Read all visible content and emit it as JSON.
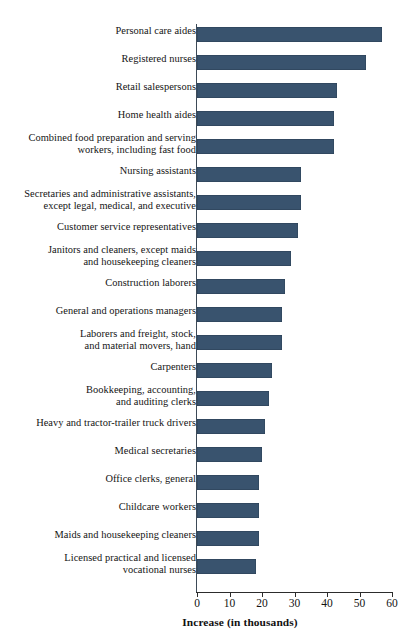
{
  "chart_data": {
    "type": "bar",
    "orientation": "horizontal",
    "title": "",
    "subtitle": "",
    "xlabel": "Increase (in thousands)",
    "ylabel": "",
    "xlim": [
      0,
      60
    ],
    "xticks": [
      0,
      10,
      20,
      30,
      40,
      50,
      60
    ],
    "xtick_labels": [
      "0",
      "10",
      "20",
      "30",
      "40",
      "50",
      "60"
    ],
    "grid": false,
    "legend": null,
    "bar_color": "#39536e",
    "axis_color": "#2c2c2c",
    "categories": [
      "Personal care aides",
      "Registered nurses",
      "Retail salespersons",
      "Home health aides",
      "Combined food preparation and serving\nworkers, including fast food",
      "Nursing assistants",
      "Secretaries and administrative assistants,\nexcept legal, medical, and executive",
      "Customer service representatives",
      "Janitors and cleaners, except maids\nand housekeeping cleaners",
      "Construction laborers",
      "General and operations managers",
      "Laborers and freight, stock,\nand material movers, hand",
      "Carpenters",
      "Bookkeeping, accounting,\nand auditing clerks",
      "Heavy and tractor-trailer truck drivers",
      "Medical secretaries",
      "Office clerks, general",
      "Childcare workers",
      "Maids and housekeeping cleaners",
      "Licensed practical and licensed\nvocational nurses"
    ],
    "values": [
      57,
      52,
      43,
      42,
      42,
      32,
      32,
      31,
      29,
      27,
      26,
      26,
      23,
      22,
      21,
      20,
      19,
      19,
      19,
      18
    ]
  }
}
